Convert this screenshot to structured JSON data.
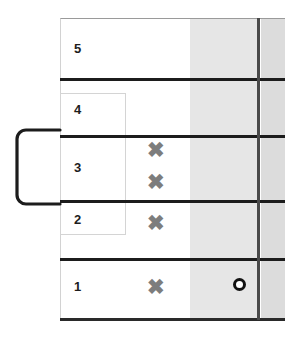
{
  "diagram": {
    "rows": [
      {
        "label": "5"
      },
      {
        "label": "4"
      },
      {
        "label": "3"
      },
      {
        "label": "2"
      },
      {
        "label": "1"
      }
    ],
    "marks": {
      "x_glyph": "✖",
      "x_color": "#7d7d7d",
      "o_color": "#121212",
      "x_positions": [
        {
          "row": "3",
          "slot": "upper"
        },
        {
          "row": "3",
          "slot": "lower"
        },
        {
          "row": "2",
          "slot": "center"
        },
        {
          "row": "1",
          "slot": "center"
        }
      ],
      "o_positions": [
        {
          "row": "1",
          "slot": "shaded-band"
        }
      ]
    },
    "bands": {
      "inner_fill": "#e6e6e6",
      "outer_fill": "#dcdcdc",
      "divider_color": "#4a4a4a"
    },
    "group_box": {
      "spans_rows": [
        "4",
        "3",
        "2"
      ],
      "border_color": "#d4d4d4"
    },
    "bracket": {
      "spans_rows": [
        "3",
        "2"
      ],
      "stroke_color": "#1c1c1c"
    },
    "grid": {
      "rule_color": "#1c1c1c",
      "frame_top_color": "#9a9a9a",
      "frame_side_color": "#d2d2d2"
    }
  }
}
